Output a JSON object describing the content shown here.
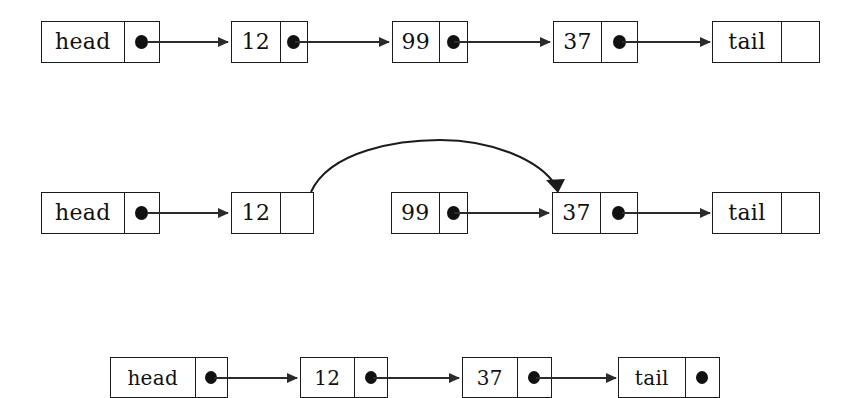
{
  "figure": {
    "background_color": "#ffffff",
    "ink_color": "#1b1b1b"
  },
  "rows": [
    {
      "id": "before",
      "caption": "Original list: head -> 12 -> 99 -> 37 -> tail",
      "nodes": [
        {
          "name": "head-node",
          "value": "head",
          "pointer": "dot"
        },
        {
          "name": "node-12",
          "value": "12",
          "pointer": "dot"
        },
        {
          "name": "node-99",
          "value": "99",
          "pointer": "dot"
        },
        {
          "name": "node-37",
          "value": "37",
          "pointer": "dot"
        },
        {
          "name": "tail-node",
          "value": "tail",
          "pointer": "empty"
        }
      ],
      "links": [
        {
          "from": "head",
          "to": "12"
        },
        {
          "from": "12",
          "to": "99"
        },
        {
          "from": "99",
          "to": "37"
        },
        {
          "from": "37",
          "to": "tail"
        }
      ]
    },
    {
      "id": "during",
      "caption": "Node 12 relinked past node 99 directly to node 37",
      "nodes": [
        {
          "name": "head-node",
          "value": "head",
          "pointer": "dot"
        },
        {
          "name": "node-12",
          "value": "12",
          "pointer": "empty"
        },
        {
          "name": "node-99",
          "value": "99",
          "pointer": "dot"
        },
        {
          "name": "node-37",
          "value": "37",
          "pointer": "dot"
        },
        {
          "name": "tail-node",
          "value": "tail",
          "pointer": "empty"
        }
      ],
      "links": [
        {
          "from": "head",
          "to": "12"
        },
        {
          "from": "99",
          "to": "37"
        },
        {
          "from": "37",
          "to": "tail"
        }
      ],
      "curved_link": {
        "from": "12",
        "to": "37"
      }
    },
    {
      "id": "after",
      "caption": "Resulting list: head -> 12 -> 37 -> tail",
      "nodes": [
        {
          "name": "head-node",
          "value": "head",
          "pointer": "dot"
        },
        {
          "name": "node-12",
          "value": "12",
          "pointer": "dot"
        },
        {
          "name": "node-37",
          "value": "37",
          "pointer": "dot"
        },
        {
          "name": "tail-node",
          "value": "tail",
          "pointer": "empty"
        }
      ],
      "links": [
        {
          "from": "head",
          "to": "12"
        },
        {
          "from": "12",
          "to": "37"
        },
        {
          "from": "37",
          "to": "tail"
        }
      ]
    }
  ]
}
